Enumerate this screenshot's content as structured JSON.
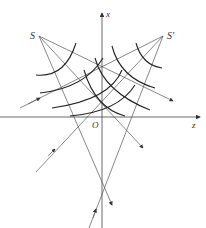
{
  "labels": {
    "source_left": "S",
    "source_right": "S'",
    "axis_x": "x",
    "axis_z": "z",
    "origin": "O"
  },
  "colors": {
    "line": "#555555",
    "arc": "#222222",
    "background": "#ffffff"
  },
  "points": {
    "S": [
      39,
      36
    ],
    "S_prime": [
      163,
      36
    ],
    "O": [
      102,
      117
    ]
  }
}
